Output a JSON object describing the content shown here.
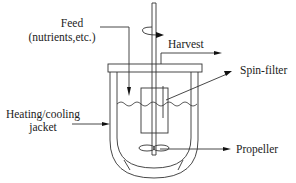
{
  "diagram": {
    "labels": {
      "feed_line1": "Feed",
      "feed_line2": "(nutrients,etc.)",
      "harvest": "Harvest",
      "spin_filter": "Spin-filter",
      "jacket_line1": "Heating/cooling",
      "jacket_line2": "jacket",
      "propeller": "Propeller"
    },
    "components": [
      {
        "id": "lid",
        "name": "Vessel lid"
      },
      {
        "id": "shaft",
        "name": "Rotating drive shaft"
      },
      {
        "id": "rotation",
        "name": "Rotation indicator"
      },
      {
        "id": "feed-inlet",
        "name": "Feed inlet"
      },
      {
        "id": "harvest-tube",
        "name": "Harvest tube"
      },
      {
        "id": "spin-filter",
        "name": "Spin-filter"
      },
      {
        "id": "liquid-surface",
        "name": "Culture liquid surface"
      },
      {
        "id": "jacket",
        "name": "Heating/cooling jacket"
      },
      {
        "id": "inner-vessel",
        "name": "Inner vessel"
      },
      {
        "id": "propeller",
        "name": "Propeller"
      }
    ],
    "colors": {
      "line": "#333333",
      "text": "#222222",
      "background": "#ffffff"
    }
  }
}
